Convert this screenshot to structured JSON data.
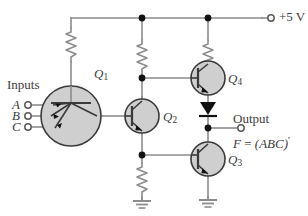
{
  "figure": {
    "type": "circuit-schematic",
    "wire_color": "#8c8c8c",
    "node_color": "#111111",
    "device_fill": "#cfcfcf",
    "device_stroke": "#3a3a3a",
    "text_color": "#3c3c3c"
  },
  "labels": {
    "supply": "+5 V",
    "inputs_heading": "Inputs",
    "input_a": "A",
    "input_b": "B",
    "input_c": "C",
    "output_heading": "Output",
    "output_expr_f": "F",
    "output_expr_eq": "=",
    "output_expr_abc": "(ABC)",
    "output_expr_prime": "'"
  },
  "transistors": [
    {
      "id": "Q1",
      "name": "Q",
      "index": "1",
      "kind": "npn-multi-emitter",
      "emitters": 3
    },
    {
      "id": "Q2",
      "name": "Q",
      "index": "2",
      "kind": "npn"
    },
    {
      "id": "Q3",
      "name": "Q",
      "index": "3",
      "kind": "npn"
    },
    {
      "id": "Q4",
      "name": "Q",
      "index": "4",
      "kind": "npn"
    }
  ],
  "resistors": [
    {
      "id": "R-base",
      "column": "left"
    },
    {
      "id": "R-q2-collector",
      "column": "middle"
    },
    {
      "id": "R-q4-collector",
      "column": "right"
    },
    {
      "id": "R-q2-emitter",
      "column": "middle-lower"
    }
  ],
  "diodes": [
    {
      "id": "D1",
      "orientation": "down",
      "between": "Q4-emitter-to-output"
    }
  ],
  "grounds": [
    {
      "id": "GND-middle"
    },
    {
      "id": "GND-right"
    }
  ],
  "terminals": [
    {
      "id": "T-supply",
      "label": "+5 V",
      "style": "open-circle"
    },
    {
      "id": "T-input-a",
      "label": "A",
      "style": "open-circle"
    },
    {
      "id": "T-input-b",
      "label": "B",
      "style": "open-circle"
    },
    {
      "id": "T-input-c",
      "label": "C",
      "style": "open-circle"
    },
    {
      "id": "T-output",
      "label": "Output",
      "style": "open-circle"
    }
  ],
  "nodes": [
    {
      "id": "N-rail-mid",
      "x": 142,
      "y": 18
    },
    {
      "id": "N-rail-right",
      "x": 208,
      "y": 18
    },
    {
      "id": "N-q2-collector",
      "x": 142,
      "y": 78
    },
    {
      "id": "N-q2-emitter",
      "x": 142,
      "y": 155
    },
    {
      "id": "N-output",
      "x": 208,
      "y": 128
    }
  ]
}
